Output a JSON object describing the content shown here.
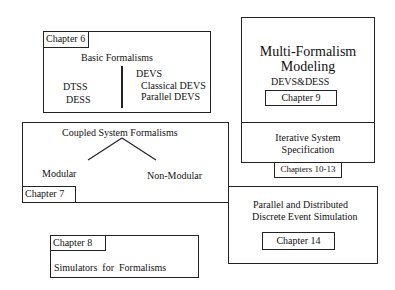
{
  "chapter6": {
    "label": "Chapter 6",
    "title": "Basic Formalisms",
    "left": [
      "DTSS",
      "DESS"
    ],
    "right_head": "DEVS",
    "right": [
      "Classical DEVS",
      "Parallel DEVS"
    ]
  },
  "chapter7": {
    "label": "Chapter 7",
    "title": "Coupled System Formalisms",
    "left": "Modular",
    "right": "Non-Modular"
  },
  "chapter8": {
    "label": "Chapter 8",
    "title": "Simulators  for  Formalisms"
  },
  "chapter9": {
    "label": "Chapter 9",
    "title1": "Multi-Formalism",
    "title2": "Modeling",
    "subtitle": "DEVS&DESS"
  },
  "chapters10_13": {
    "label": "Chapters 10-13",
    "title1": "Iterative System",
    "title2": "Specification"
  },
  "chapter14": {
    "label": "Chapter 14",
    "title1": "Parallel and Distributed",
    "title2": "Discrete Event Simulation"
  }
}
